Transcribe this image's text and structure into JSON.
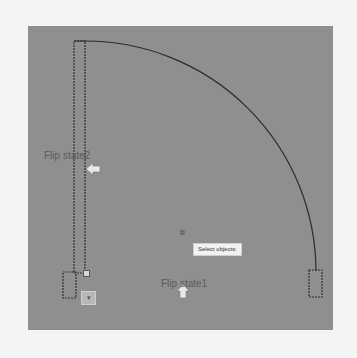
{
  "canvas": {
    "background": "#8f8f8f",
    "page_background": "#f4f4f4"
  },
  "labels": {
    "flip_state2": "Flip state2",
    "flip_state1": "Flip state1"
  },
  "tooltip": {
    "text": "Select objects:"
  },
  "lookup_grip": {
    "glyph": "▾"
  },
  "icons": {
    "flip_state2_arrow": "arrow-left-icon",
    "flip_state1_arrow": "arrow-up-icon",
    "cursor": "crosshair-icon"
  }
}
